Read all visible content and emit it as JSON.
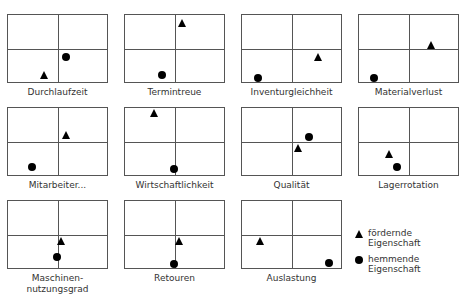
{
  "chart_data": {
    "type": "scatter",
    "title": "",
    "panels": [
      {
        "label": "Durchlaufzeit",
        "triangle": {
          "x": 0.36,
          "y": 0.9
        },
        "circle": {
          "x": 0.59,
          "y": 0.62
        }
      },
      {
        "label": "Termintreue",
        "triangle": {
          "x": 0.58,
          "y": 0.12
        },
        "circle": {
          "x": 0.37,
          "y": 0.9
        }
      },
      {
        "label": "Inventurgleichheit",
        "triangle": {
          "x": 0.77,
          "y": 0.63
        },
        "circle": {
          "x": 0.16,
          "y": 0.94
        }
      },
      {
        "label": "Materialverlust",
        "triangle": {
          "x": 0.73,
          "y": 0.45
        },
        "circle": {
          "x": 0.15,
          "y": 0.94
        }
      },
      {
        "label": "Mitarbeiter...",
        "triangle": {
          "x": 0.59,
          "y": 0.4
        },
        "circle": {
          "x": 0.24,
          "y": 0.88
        }
      },
      {
        "label": "Wirtschaftlichkeit",
        "triangle": {
          "x": 0.29,
          "y": 0.07
        },
        "circle": {
          "x": 0.49,
          "y": 0.91
        }
      },
      {
        "label": "Qualität",
        "triangle": {
          "x": 0.57,
          "y": 0.59
        },
        "circle": {
          "x": 0.68,
          "y": 0.43
        }
      },
      {
        "label": "Lagerrotation",
        "triangle": {
          "x": 0.3,
          "y": 0.69
        },
        "circle": {
          "x": 0.38,
          "y": 0.88
        }
      },
      {
        "label": "Maschinen-\nnutzungsgrad",
        "triangle": {
          "x": 0.54,
          "y": 0.59
        },
        "circle": {
          "x": 0.49,
          "y": 0.84
        }
      },
      {
        "label": "Retouren",
        "triangle": {
          "x": 0.55,
          "y": 0.6
        },
        "circle": {
          "x": 0.49,
          "y": 0.94
        }
      },
      {
        "label": "Auslastung",
        "triangle": {
          "x": 0.18,
          "y": 0.59
        },
        "circle": {
          "x": 0.88,
          "y": 0.93
        }
      }
    ],
    "legend": [
      {
        "marker": "triangle",
        "label": "fördernde\nEigenschaft"
      },
      {
        "marker": "circle",
        "label": "hemmende\nEigenschaft"
      }
    ],
    "grid": false
  }
}
